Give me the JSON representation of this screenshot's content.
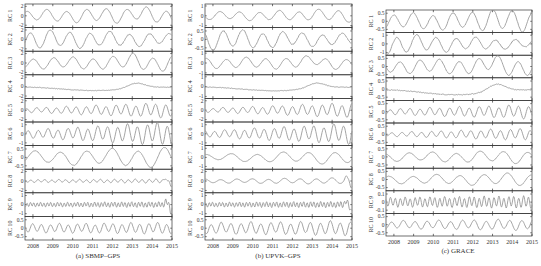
{
  "figure": {
    "width": 541,
    "height": 266,
    "line_color": "#9a9a9a",
    "axis_color": "#333333"
  },
  "chart_data": [
    {
      "type": "line",
      "id": "a",
      "caption": "(a) SBMP–GPS",
      "xlabel": "",
      "x_ticks": [
        2008,
        2009,
        2010,
        2011,
        2012,
        2013,
        2014,
        2015
      ],
      "x_range": [
        2007.6,
        2015.0
      ],
      "plot_box": {
        "left": 25,
        "right": 172,
        "top": 4,
        "bottom": 240
      },
      "caption_pos": {
        "x": 98,
        "y": 257
      },
      "subplots": [
        {
          "label": "RC 1",
          "yticks": [
            "2",
            "0",
            "-2"
          ],
          "ylim": [
            -2.5,
            2.5
          ],
          "period": 1.0,
          "amp": 1.0,
          "growth": 0.6,
          "trend": "bump2013",
          "seed": 1
        },
        {
          "label": "RC 2",
          "yticks": [
            "2",
            "0",
            "-2"
          ],
          "ylim": [
            -2.5,
            2.5
          ],
          "period": 1.0,
          "amp": 1.8,
          "growth": -0.4,
          "trend": "none",
          "seed": 2
        },
        {
          "label": "RC 3",
          "yticks": [
            "2",
            "0",
            "-2"
          ],
          "ylim": [
            -2.5,
            2.5
          ],
          "period": 1.0,
          "amp": 1.0,
          "growth": 0.3,
          "trend": "bump2013",
          "seed": 3
        },
        {
          "label": "RC 4",
          "yticks": [
            "2",
            "0",
            "-2"
          ],
          "ylim": [
            -2.5,
            2.5
          ],
          "period": 6.0,
          "amp": 1.2,
          "growth": 0.3,
          "trend": "slow",
          "seed": 4
        },
        {
          "label": "RC 5",
          "yticks": [
            "2",
            "0",
            "-2"
          ],
          "ylim": [
            -2.5,
            2.5
          ],
          "period": 0.5,
          "amp": 0.4,
          "growth": 2.5,
          "trend": "none",
          "seed": 5
        },
        {
          "label": "RC 6",
          "yticks": [
            "1",
            "0",
            "-1"
          ],
          "ylim": [
            -1.3,
            1.3
          ],
          "period": 0.5,
          "amp": 0.35,
          "growth": 2.2,
          "trend": "none",
          "seed": 6
        },
        {
          "label": "RC 7",
          "yticks": [
            "0.5",
            "0",
            "-0.5"
          ],
          "ylim": [
            -0.7,
            0.7
          ],
          "period": 1.3,
          "amp": 0.3,
          "growth": 0.8,
          "trend": "none",
          "seed": 7
        },
        {
          "label": "RC 8",
          "yticks": [
            "2",
            "0",
            "-2"
          ],
          "ylim": [
            -2.5,
            2.5
          ],
          "period": 0.35,
          "amp": 0.25,
          "growth": 0.5,
          "trend": "endspike",
          "seed": 8
        },
        {
          "label": "RC 9",
          "yticks": [
            "1",
            "0",
            "-1"
          ],
          "ylim": [
            -1.3,
            1.3
          ],
          "period": 0.17,
          "amp": 0.2,
          "growth": 0.4,
          "trend": "endspike",
          "seed": 9
        },
        {
          "label": "RC 10",
          "yticks": [
            "0.5",
            "0",
            "-0.5"
          ],
          "ylim": [
            -0.7,
            0.7
          ],
          "period": 0.45,
          "amp": 0.22,
          "growth": 0.3,
          "trend": "none",
          "seed": 10
        }
      ]
    },
    {
      "type": "line",
      "id": "b",
      "caption": "(b) UPVK–GPS",
      "xlabel": "",
      "x_ticks": [
        2008,
        2009,
        2010,
        2011,
        2012,
        2013,
        2014,
        2015
      ],
      "x_range": [
        2007.6,
        2015.0
      ],
      "plot_box": {
        "left": 205,
        "right": 352,
        "top": 4,
        "bottom": 240
      },
      "caption_pos": {
        "x": 278,
        "y": 257
      },
      "subplots": [
        {
          "label": "RC 1",
          "yticks": [
            "1",
            "0",
            "-1"
          ],
          "ylim": [
            -1.2,
            1.2
          ],
          "period": 1.0,
          "amp": 0.35,
          "growth": 0.5,
          "trend": "bump2013",
          "seed": 11
        },
        {
          "label": "RC 2",
          "yticks": [
            "0.5",
            "0",
            "-0.5"
          ],
          "ylim": [
            -0.7,
            0.7
          ],
          "period": 1.0,
          "amp": 0.55,
          "growth": -0.5,
          "trend": "none",
          "seed": 12
        },
        {
          "label": "RC 3",
          "yticks": [
            "1",
            "0",
            "-1"
          ],
          "ylim": [
            -1.2,
            1.2
          ],
          "period": 1.0,
          "amp": 0.45,
          "growth": 0.2,
          "trend": "bump2013",
          "seed": 13
        },
        {
          "label": "RC 4",
          "yticks": [
            "1",
            "0",
            "-1"
          ],
          "ylim": [
            -1.2,
            1.2
          ],
          "period": 6.0,
          "amp": 0.6,
          "growth": 0.3,
          "trend": "slow",
          "seed": 14
        },
        {
          "label": "RC 5",
          "yticks": [
            "2",
            "0",
            "-2"
          ],
          "ylim": [
            -2.5,
            2.5
          ],
          "period": 0.5,
          "amp": 0.35,
          "growth": 2.8,
          "trend": "none",
          "seed": 15
        },
        {
          "label": "RC 6",
          "yticks": [
            "1",
            "0",
            "-1"
          ],
          "ylim": [
            -1.3,
            1.3
          ],
          "period": 0.5,
          "amp": 0.3,
          "growth": 2.2,
          "trend": "none",
          "seed": 16
        },
        {
          "label": "RC 7",
          "yticks": [
            "1",
            "0",
            "-1"
          ],
          "ylim": [
            -1.3,
            1.3
          ],
          "period": 1.3,
          "amp": 0.3,
          "growth": 1.2,
          "trend": "none",
          "seed": 17
        },
        {
          "label": "RC 8",
          "yticks": [
            "2",
            "0",
            "-2"
          ],
          "ylim": [
            -2.5,
            2.5
          ],
          "period": 0.8,
          "amp": 0.35,
          "growth": 0.6,
          "trend": "endspike",
          "seed": 18
        },
        {
          "label": "RC 9",
          "yticks": [
            "1",
            "0",
            "-1"
          ],
          "ylim": [
            -1.3,
            1.3
          ],
          "period": 0.17,
          "amp": 0.22,
          "growth": 0.4,
          "trend": "endspike",
          "seed": 19
        },
        {
          "label": "RC 10",
          "yticks": [
            "0.5",
            "0",
            "-0.5"
          ],
          "ylim": [
            -0.7,
            0.7
          ],
          "period": 0.5,
          "amp": 0.28,
          "growth": 0.3,
          "trend": "none",
          "seed": 20
        }
      ]
    },
    {
      "type": "line",
      "id": "c",
      "caption": "(c) GRACE",
      "xlabel": "",
      "x_ticks": [
        2008,
        2009,
        2010,
        2011,
        2012,
        2013,
        2014,
        2015
      ],
      "x_range": [
        2007.6,
        2015.0
      ],
      "plot_box": {
        "left": 386,
        "right": 532,
        "top": 10,
        "bottom": 236
      },
      "caption_pos": {
        "x": 458,
        "y": 252
      },
      "subplots": [
        {
          "label": "RC 1",
          "yticks": [
            "0.5",
            "0",
            "-0.5"
          ],
          "ylim": [
            -0.7,
            0.7
          ],
          "period": 1.0,
          "amp": 0.4,
          "growth": 0.4,
          "trend": "bump2013",
          "seed": 21
        },
        {
          "label": "RC 2",
          "yticks": [
            "1",
            "0",
            "-1"
          ],
          "ylim": [
            -1.3,
            1.3
          ],
          "period": 1.0,
          "amp": 1.0,
          "growth": -0.6,
          "trend": "none",
          "seed": 22
        },
        {
          "label": "RC 3",
          "yticks": [
            "0.5",
            "0",
            "-0.5"
          ],
          "ylim": [
            -0.7,
            0.7
          ],
          "period": 1.0,
          "amp": 0.35,
          "growth": 0.3,
          "trend": "bump2013",
          "seed": 23
        },
        {
          "label": "RC 4",
          "yticks": [
            "0.5",
            "0",
            "-0.5"
          ],
          "ylim": [
            -0.7,
            0.7
          ],
          "period": 6.0,
          "amp": 0.5,
          "growth": 0.2,
          "trend": "slow",
          "seed": 24
        },
        {
          "label": "RC 5",
          "yticks": [
            "0.5",
            "0",
            "-0.5"
          ],
          "ylim": [
            -0.7,
            0.7
          ],
          "period": 0.5,
          "amp": 0.15,
          "growth": 1.5,
          "trend": "none",
          "seed": 25
        },
        {
          "label": "RC 6",
          "yticks": [
            "0.5",
            "0",
            "-0.5"
          ],
          "ylim": [
            -0.7,
            0.7
          ],
          "period": 0.5,
          "amp": 0.1,
          "growth": 2.2,
          "trend": "none",
          "seed": 26
        },
        {
          "label": "RC 7",
          "yticks": [
            "0.5",
            "0",
            "-0.5"
          ],
          "ylim": [
            -0.7,
            0.7
          ],
          "period": 1.2,
          "amp": 0.22,
          "growth": 0.6,
          "trend": "none",
          "seed": 27
        },
        {
          "label": "RC 8",
          "yticks": [
            "0.5",
            "0",
            "-0.5"
          ],
          "ylim": [
            -0.7,
            0.7
          ],
          "period": 1.2,
          "amp": 0.2,
          "growth": 0.8,
          "trend": "none",
          "seed": 28
        },
        {
          "label": "RC 9",
          "yticks": [
            "0.1",
            "0",
            "-0.1"
          ],
          "ylim": [
            -0.14,
            0.14
          ],
          "period": 0.25,
          "amp": 0.05,
          "growth": 0.3,
          "trend": "none",
          "seed": 29
        },
        {
          "label": "RC 10",
          "yticks": [
            "0.5",
            "0",
            "-0.5"
          ],
          "ylim": [
            -0.7,
            0.7
          ],
          "period": 0.6,
          "amp": 0.2,
          "growth": 0.5,
          "trend": "none",
          "seed": 30
        }
      ]
    }
  ]
}
